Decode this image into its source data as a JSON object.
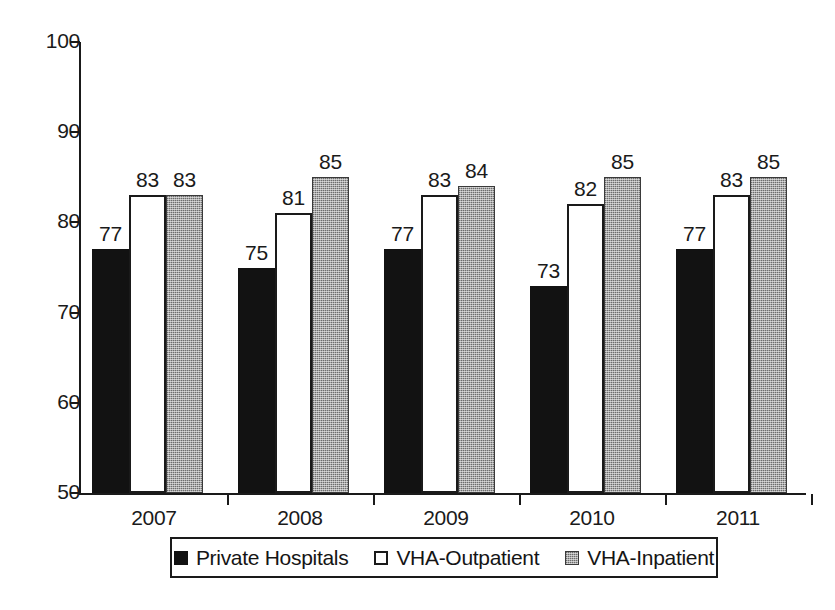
{
  "chart_data": {
    "type": "bar",
    "title": "",
    "subtitle": "",
    "xlabel": "",
    "ylabel": "",
    "categories": [
      "2007",
      "2008",
      "2009",
      "2010",
      "2011"
    ],
    "series": [
      {
        "name": "Private Hospitals",
        "values": [
          77,
          75,
          77,
          73,
          77
        ],
        "swatch": "solid-black",
        "color": "#121212"
      },
      {
        "name": "VHA-Outpatient",
        "values": [
          83,
          81,
          83,
          82,
          83
        ],
        "swatch": "outlined-white",
        "color": "#ffffff"
      },
      {
        "name": "VHA-Inpatient",
        "values": [
          83,
          85,
          84,
          85,
          85
        ],
        "swatch": "gray-stipple",
        "color": "#a8a8a8"
      }
    ],
    "ylim": [
      50,
      100
    ],
    "ytick_labels": [
      "100",
      "90",
      "80",
      "70",
      "60",
      "50"
    ],
    "ytick_values": [
      100,
      90,
      80,
      70,
      60,
      50
    ],
    "grid": false,
    "data_labels": true,
    "legend_position": "bottom"
  },
  "legend": {
    "items": [
      {
        "label": "Private Hospitals"
      },
      {
        "label": "VHA-Outpatient"
      },
      {
        "label": "VHA-Inpatient"
      }
    ]
  }
}
